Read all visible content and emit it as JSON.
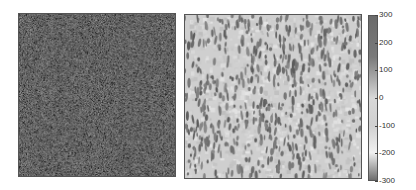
{
  "chart_data": [
    {
      "type": "heatmap",
      "title": "",
      "description": "Left panel: dense fine-grained random speckle field, mostly mid-to-dark gray values",
      "xlabel": "",
      "ylabel": "",
      "texture": "fine-speckle",
      "tone": "dark"
    },
    {
      "type": "heatmap",
      "title": "",
      "description": "Right panel: light background with vertically elongated darker blobs",
      "xlabel": "",
      "ylabel": "",
      "texture": "vertical-streaks",
      "tone": "light"
    }
  ],
  "colorbar": {
    "ticks": [
      "300",
      "200",
      "100",
      "0",
      "-100",
      "-200",
      "-300"
    ],
    "tick_values": [
      300,
      200,
      100,
      0,
      -100,
      -200,
      -300
    ],
    "range": [
      -300,
      300
    ],
    "colormap_stops": [
      {
        "value": 300,
        "color": "#6a6a6a"
      },
      {
        "value": 150,
        "color": "#7a7a7a"
      },
      {
        "value": 60,
        "color": "#b0b0b0"
      },
      {
        "value": 0,
        "color": "#d8d8d8"
      },
      {
        "value": -100,
        "color": "#d0d0d0"
      },
      {
        "value": -200,
        "color": "#f0f0f0"
      },
      {
        "value": -300,
        "color": "#6e6e6e"
      }
    ]
  }
}
